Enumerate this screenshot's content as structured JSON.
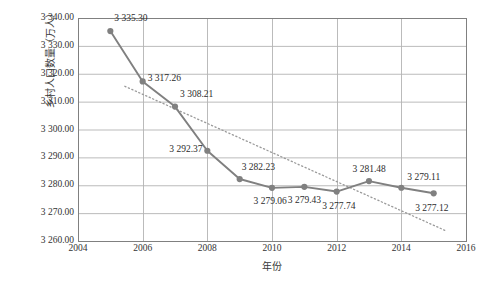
{
  "chart_data": {
    "type": "line",
    "title": "",
    "xlabel": "年份",
    "ylabel": "乡村人口数量（万人）",
    "x": [
      2005,
      2006,
      2007,
      2008,
      2009,
      2010,
      2011,
      2012,
      2013,
      2014,
      2015
    ],
    "values": [
      3335.3,
      3317.26,
      3308.21,
      3292.37,
      3282.23,
      3279.06,
      3279.43,
      3277.74,
      3281.48,
      3279.11,
      3277.12
    ],
    "point_labels": [
      "3 335.30",
      "3 317.26",
      "3 308.21",
      "3 292.37",
      "3 282.23",
      "3 279.06",
      "3 279.43",
      "3 277.74",
      "3 281.48",
      "3 279.11",
      "3 277.12"
    ],
    "xlim": [
      2004,
      2016
    ],
    "ylim": [
      3260.0,
      3340.0
    ],
    "xticks": [
      2004,
      2006,
      2008,
      2010,
      2012,
      2014,
      2016
    ],
    "xtick_labels": [
      "2004",
      "2006",
      "2008",
      "2010",
      "2012",
      "2014",
      "2016"
    ],
    "yticks": [
      3260.0,
      3270.0,
      3280.0,
      3290.0,
      3300.0,
      3310.0,
      3320.0,
      3330.0,
      3340.0
    ],
    "ytick_labels": [
      "3 260.00",
      "3 270.00",
      "3 280.00",
      "3 290.00",
      "3 300.00",
      "3 310.00",
      "3 320.00",
      "3 330.00",
      "3 340.00"
    ],
    "grid": true,
    "legend": "none",
    "series": [
      {
        "name": "乡村人口数量",
        "style": "solid-line-with-markers",
        "color": "#808080",
        "values": [
          3335.3,
          3317.26,
          3308.21,
          3292.37,
          3282.23,
          3279.06,
          3279.43,
          3277.74,
          3281.48,
          3279.11,
          3277.12
        ]
      },
      {
        "name": "线性趋势线",
        "style": "dotted-trendline",
        "color": "#9a9a9a",
        "endpoints": [
          {
            "x": 2005.45,
            "y": 3315.5
          },
          {
            "x": 2015.35,
            "y": 3263.8
          }
        ]
      }
    ],
    "label_offsets": [
      {
        "dx": 4,
        "dy": -13,
        "align": "left"
      },
      {
        "dx": 5,
        "dy": -3,
        "align": "left"
      },
      {
        "dx": 5,
        "dy": -13,
        "align": "left"
      },
      {
        "dx": -5,
        "dy": -2,
        "align": "right"
      },
      {
        "dx": 2,
        "dy": -12,
        "align": "left"
      },
      {
        "dx": -2,
        "dy": 13,
        "align": "center"
      },
      {
        "dx": 0,
        "dy": 13,
        "align": "center"
      },
      {
        "dx": 2,
        "dy": 14,
        "align": "center"
      },
      {
        "dx": 0,
        "dy": -12,
        "align": "center"
      },
      {
        "dx": 6,
        "dy": -11,
        "align": "left"
      },
      {
        "dx": -2,
        "dy": 15,
        "align": "center"
      }
    ],
    "colors": {
      "series": "#808080",
      "trendline": "#9a9a9a",
      "grid": "#b3b3b3",
      "axis": "#808080",
      "text": "#2c2c2c",
      "background": "#ffffff"
    },
    "plot_area": {
      "left": 78,
      "top": 18,
      "right": 466,
      "bottom": 241
    }
  }
}
